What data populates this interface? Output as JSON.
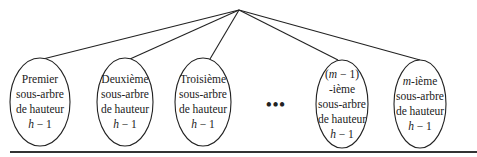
{
  "diagram": {
    "type": "tree",
    "root": {
      "x": 239,
      "y": 10
    },
    "subtrees": [
      {
        "id": "s1",
        "lines": [
          "Premier",
          "sous-arbre",
          "de hauteur",
          "h − 1"
        ],
        "cx": 40,
        "cy": 102,
        "rx": 30,
        "ry": 44,
        "attach": [
          43,
          59
        ]
      },
      {
        "id": "s2",
        "lines": [
          "Deuxième",
          "sous-arbre",
          "de hauteur",
          "h − 1"
        ],
        "cx": 125,
        "cy": 102,
        "rx": 28,
        "ry": 44,
        "attach": [
          130,
          59
        ]
      },
      {
        "id": "s3",
        "lines": [
          "Troisième",
          "sous-arbre",
          "de hauteur",
          "h − 1"
        ],
        "cx": 203,
        "cy": 102,
        "rx": 28,
        "ry": 44,
        "attach": [
          210,
          59
        ]
      },
      {
        "id": "s4",
        "lines": [
          "(m − 1)",
          "-ième",
          "sous-arbre",
          "de hauteur",
          "h − 1"
        ],
        "cx": 342,
        "cy": 104,
        "rx": 26,
        "ry": 44,
        "attach": [
          338,
          60
        ]
      },
      {
        "id": "s5",
        "lines": [
          "m-ième",
          "sous-arbre",
          "de hauteur",
          "h − 1"
        ],
        "cx": 420,
        "cy": 104,
        "rx": 26,
        "ry": 44,
        "attach": [
          420,
          60
        ]
      }
    ],
    "ellipsis": {
      "text": "•••",
      "x": 276,
      "y": 105
    },
    "baseline": {
      "x1": 10,
      "x2": 477,
      "y": 151
    }
  }
}
